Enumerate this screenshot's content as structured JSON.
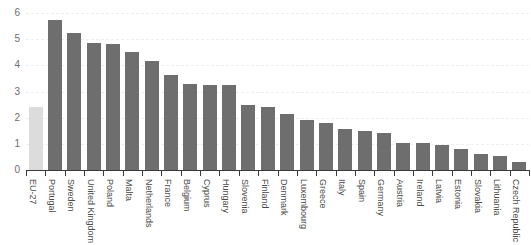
{
  "chart_data": {
    "type": "bar",
    "title": "",
    "subtitle": "",
    "xlabel": "",
    "ylabel": "",
    "ylim": [
      0,
      6
    ],
    "yticks": [
      0,
      1,
      2,
      3,
      4,
      5,
      6
    ],
    "ytick_labels": [
      "0",
      "1",
      "2",
      "3",
      "4",
      "5",
      "6"
    ],
    "grid": true,
    "grid_style": "dashed-horizontal",
    "legend": "none",
    "bar_color": "#6e6e6e",
    "highlight_color": "#dcdcdc",
    "highlight_category": "EU-27",
    "categories": [
      "EU-27",
      "Portugal",
      "Sweden",
      "United Kingdom",
      "Poland",
      "Malta",
      "Netherlands",
      "France",
      "Belgium",
      "Cyprus",
      "Hungary",
      "Slovenia",
      "Finland",
      "Denmark",
      "Luxembourg",
      "Greece",
      "Italy",
      "Spain",
      "Germany",
      "Austria",
      "Ireland",
      "Latvia",
      "Estonia",
      "Slovakia",
      "Lithuania",
      "Czech Republic"
    ],
    "values": [
      2.4,
      5.75,
      5.25,
      4.85,
      4.8,
      4.5,
      4.15,
      3.65,
      3.3,
      3.25,
      3.25,
      2.5,
      2.4,
      2.15,
      1.9,
      1.8,
      1.55,
      1.5,
      1.4,
      1.05,
      1.05,
      0.95,
      0.8,
      0.6,
      0.55,
      0.3
    ]
  }
}
